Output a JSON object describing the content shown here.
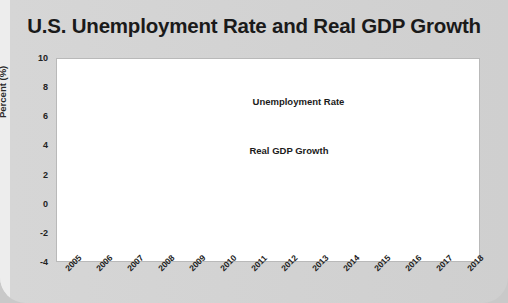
{
  "chart_data": {
    "type": "line",
    "title": "U.S. Unemployment Rate and Real GDP Growth",
    "xlabel": "",
    "ylabel": "Percent (%)",
    "ylim": [
      -4,
      10
    ],
    "ytick_values": [
      10,
      8,
      6,
      4,
      2,
      0,
      -2,
      -4
    ],
    "ytick_labels": [
      "10",
      "8",
      "6",
      "4",
      "2",
      "0",
      "-2",
      "-4"
    ],
    "grid": true,
    "legend": "inline-annotations",
    "categories": [
      2005,
      2006,
      2007,
      2008,
      2009,
      2010,
      2011,
      2012,
      2013,
      2014,
      2015,
      2016,
      2017,
      2018
    ],
    "xtick_labels": [
      "2005",
      "2006",
      "2007",
      "2008",
      "2009",
      "2010",
      "2011",
      "2012",
      "2013",
      "2014",
      "2015",
      "2016",
      "2017",
      "2018"
    ],
    "series": [
      {
        "name": "Unemployment Rate",
        "color": "#4d4d4d",
        "values": [
          5.1,
          4.6,
          4.6,
          5.8,
          9.3,
          9.6,
          8.9,
          8.1,
          7.4,
          6.2,
          5.3,
          4.9,
          4.4,
          3.9
        ]
      },
      {
        "name": "Real GDP Growth",
        "color": "#1a1a1a",
        "values": [
          3.5,
          2.9,
          1.9,
          -0.1,
          -2.5,
          2.6,
          1.6,
          2.2,
          1.9,
          2.5,
          2.9,
          1.6,
          2.2,
          2.9
        ]
      }
    ],
    "annotations": [
      {
        "text": "Unemployment Rate",
        "x": 2011.0,
        "y": 7.0
      },
      {
        "text": "Real GDP Growth",
        "x": 2010.9,
        "y": 3.6
      }
    ],
    "shaded_region": {
      "label": "recession",
      "x_start": 2007.5,
      "x_end": 2009.4,
      "color": "#d6d6d6"
    },
    "zero_line": 0
  }
}
